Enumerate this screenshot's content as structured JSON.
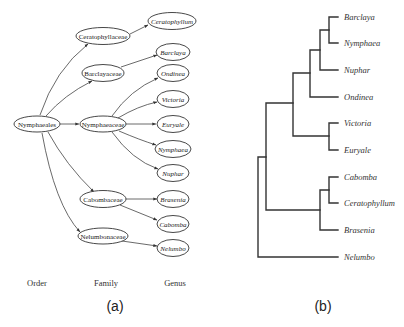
{
  "panel_a": {
    "label": "(a)",
    "columns": {
      "order": "Order",
      "family": "Family",
      "genus": "Genus"
    },
    "order": {
      "name": "Nymphaeales"
    },
    "families": [
      {
        "name": "Ceratophyllaceae"
      },
      {
        "name": "Barclayaceae"
      },
      {
        "name": "Nymphaeaceae"
      },
      {
        "name": "Cabombaceae"
      },
      {
        "name": "Nelumbonaceae"
      }
    ],
    "genera": [
      {
        "name": "Ceratophyllum",
        "family": "Ceratophyllaceae"
      },
      {
        "name": "Barclaya",
        "family": "Barclayaceae"
      },
      {
        "name": "Ondinea",
        "family": "Nymphaeaceae"
      },
      {
        "name": "Victoria",
        "family": "Nymphaeaceae"
      },
      {
        "name": "Euryale",
        "family": "Nymphaeaceae"
      },
      {
        "name": "Nymphaea",
        "family": "Nymphaeaceae"
      },
      {
        "name": "Nuphar",
        "family": "Nymphaeaceae"
      },
      {
        "name": "Brasenia",
        "family": "Cabombaceae"
      },
      {
        "name": "Cabomba",
        "family": "Cabombaceae"
      },
      {
        "name": "Nelumbo",
        "family": "Nelumbonaceae"
      }
    ]
  },
  "panel_b": {
    "label": "(b)",
    "leaves": [
      {
        "name": "Barclaya"
      },
      {
        "name": "Nymphaea"
      },
      {
        "name": "Nuphar"
      },
      {
        "name": "Ondinea"
      },
      {
        "name": "Victoria"
      },
      {
        "name": "Euryale"
      },
      {
        "name": "Cabomba"
      },
      {
        "name": "Ceratophyllum"
      },
      {
        "name": "Brasenia"
      },
      {
        "name": "Nelumbo"
      }
    ],
    "newick": "((((((Barclaya,Nymphaea),Nuphar),Ondinea),(Victoria,Euryale)),((Cabomba,Ceratophyllum),Brasenia)),Nelumbo);"
  }
}
